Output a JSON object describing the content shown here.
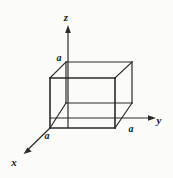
{
  "figure": {
    "type": "3d-cube-axes-diagram",
    "background_color": "#fbfbfa",
    "ink_color": "#2a2a2a",
    "axes": [
      {
        "id": "z",
        "label": "z",
        "direction": "up",
        "label_x": 66,
        "label_y": 21
      },
      {
        "id": "y",
        "label": "y",
        "direction": "right",
        "label_x": 159,
        "label_y": 124
      },
      {
        "id": "x",
        "label": "x",
        "direction": "down-left",
        "label_x": 10,
        "label_y": 166
      }
    ],
    "dimension_labels": [
      {
        "id": "a-z",
        "label": "a",
        "axis": "z",
        "x": 57,
        "y": 61
      },
      {
        "id": "a-y",
        "label": "a",
        "axis": "y",
        "x": 129,
        "y": 132
      },
      {
        "id": "a-x",
        "label": "a",
        "axis": "x",
        "x": 45,
        "y": 139
      }
    ],
    "cube": {
      "edge_label": "a",
      "vertices": {
        "front_bottom_left": [
          50,
          128
        ],
        "front_bottom_right": [
          115,
          128
        ],
        "front_top_left": [
          50,
          78
        ],
        "front_top_right": [
          115,
          78
        ],
        "back_bottom_left": [
          66,
          103
        ],
        "back_bottom_right": [
          132,
          103
        ],
        "back_top_left": [
          66,
          62
        ],
        "back_top_right": [
          132,
          62
        ]
      }
    },
    "geometry": {
      "z_axis": {
        "x": 68,
        "y_top": 26,
        "y_bottom": 128
      },
      "y_axis": {
        "y": 118,
        "x_left": 50,
        "x_right": 155
      },
      "x_axis": {
        "x1": 50,
        "y1": 128,
        "x2": 24,
        "y2": 153
      }
    }
  }
}
